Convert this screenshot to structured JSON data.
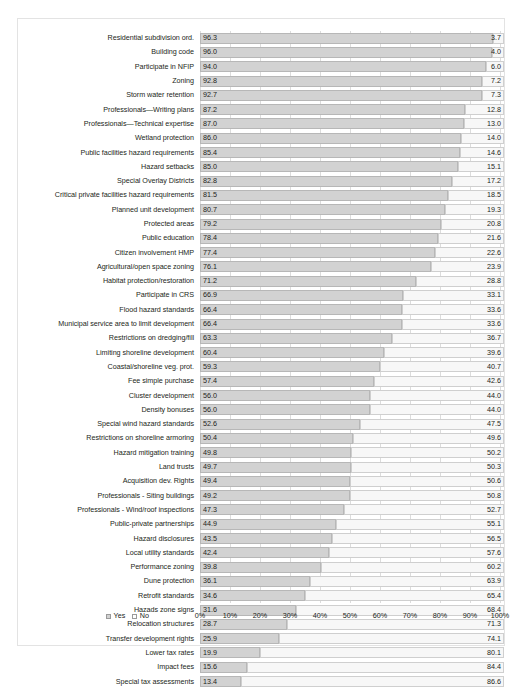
{
  "chart_data": {
    "type": "bar",
    "orientation": "horizontal",
    "stacked": true,
    "percent": true,
    "title": "",
    "subtitle": "",
    "xlabel": "",
    "ylabel": "",
    "xlim": [
      0,
      100
    ],
    "grid": true,
    "legend_position": "bottom-left",
    "x_ticks": [
      "0%",
      "10%",
      "20%",
      "30%",
      "40%",
      "50%",
      "60%",
      "70%",
      "80%",
      "90%",
      "100%"
    ],
    "x_tick_values": [
      0,
      10,
      20,
      30,
      40,
      50,
      60,
      70,
      80,
      90,
      100
    ],
    "legend": [
      {
        "label": "Yes",
        "color": "#d2d2d2",
        "swatch": "yes"
      },
      {
        "label": "No",
        "color": "#ffffff",
        "swatch": "no"
      }
    ],
    "series": [
      {
        "name": "Yes",
        "color": "#d2d2d2"
      },
      {
        "name": "No",
        "color": "#f7f7f7"
      }
    ],
    "categories": [
      "Residential subdivision ord.",
      "Building code",
      "Participate in NFIP",
      "Zoning",
      "Storm water retention",
      "Professionals—Writing plans",
      "Professionals—Technical expertise",
      "Wetland protection",
      "Public facilities hazard requirements",
      "Hazard setbacks",
      "Special Overlay Districts",
      "Critical private facilities hazard requirements",
      "Planned unit development",
      "Protected areas",
      "Public education",
      "Citizen involvement HMP",
      "Agricultural/open space zoning",
      "Habitat protection/restoration",
      "Participate in CRS",
      "Flood hazard standards",
      "Municipal service area to limit development",
      "Restrictions on dredging/fill",
      "Limiting shoreline development",
      "Coastal/shoreline veg. prot.",
      "Fee simple purchase",
      "Cluster development",
      "Density bonuses",
      "Special wind hazard standards",
      "Restrictions on shoreline armoring",
      "Hazard mitigation training",
      "Land trusts",
      "Acquisition dev. Rights",
      "Professionals - Siting buildings",
      "Professionals - Wind/roof inspections",
      "Public-private partnerships",
      "Hazard disclosures",
      "Local utility standards",
      "Performance zoning",
      "Dune protection",
      "Retrofit standards",
      "Hazads zone signs",
      "Relocation structures",
      "Transfer development rights",
      "Lower tax rates",
      "Impact fees",
      "Special tax assessments"
    ],
    "yes_values": [
      96.3,
      96.0,
      94.0,
      92.8,
      92.7,
      87.2,
      87.0,
      86.0,
      85.4,
      85.0,
      82.8,
      81.5,
      80.7,
      79.2,
      78.4,
      77.4,
      76.1,
      71.2,
      66.9,
      66.4,
      66.4,
      63.3,
      60.4,
      59.3,
      57.4,
      56.0,
      56.0,
      52.6,
      50.4,
      49.8,
      49.7,
      49.4,
      49.2,
      47.3,
      44.9,
      43.5,
      42.4,
      39.8,
      36.1,
      34.6,
      31.6,
      28.7,
      25.9,
      19.9,
      15.6,
      13.4
    ],
    "no_values": [
      3.7,
      4.0,
      6.0,
      7.2,
      7.3,
      12.8,
      13.0,
      14.0,
      14.6,
      15.1,
      17.2,
      18.5,
      19.3,
      20.8,
      21.6,
      22.6,
      23.9,
      28.8,
      33.1,
      33.6,
      33.6,
      36.7,
      39.6,
      40.7,
      42.6,
      44.0,
      44.0,
      47.5,
      49.6,
      50.2,
      50.3,
      50.6,
      50.8,
      52.7,
      55.1,
      56.5,
      57.6,
      60.2,
      63.9,
      65.4,
      68.4,
      71.3,
      74.1,
      80.1,
      84.4,
      86.6
    ],
    "yes_labels": [
      "96.3",
      "96.0",
      "94.0",
      "92.8",
      "92.7",
      "87.2",
      "87.0",
      "86.0",
      "85.4",
      "85.0",
      "82.8",
      "81.5",
      "80.7",
      "79.2",
      "78.4",
      "77.4",
      "76.1",
      "71.2",
      "66.9",
      "66.4",
      "66.4",
      "63.3",
      "60.4",
      "59.3",
      "57.4",
      "56.0",
      "56.0",
      "52.6",
      "50.4",
      "49.8",
      "49.7",
      "49.4",
      "49.2",
      "47.3",
      "44.9",
      "43.5",
      "42.4",
      "39.8",
      "36.1",
      "34.6",
      "31.6",
      "28.7",
      "25.9",
      "19.9",
      "15.6",
      "13.4"
    ],
    "no_labels": [
      "3.7",
      "4.0",
      "6.0",
      "7.2",
      "7.3",
      "12.8",
      "13.0",
      "14.0",
      "14.6",
      "15.1",
      "17.2",
      "18.5",
      "19.3",
      "20.8",
      "21.6",
      "22.6",
      "23.9",
      "28.8",
      "33.1",
      "33.6",
      "33.6",
      "36.7",
      "39.6",
      "40.7",
      "42.6",
      "44.0",
      "44.0",
      "47.5",
      "49.6",
      "50.2",
      "50.3",
      "50.6",
      "50.8",
      "52.7",
      "55.1",
      "56.5",
      "57.6",
      "60.2",
      "63.9",
      "65.4",
      "68.4",
      "71.3",
      "74.1",
      "80.1",
      "84.4",
      "86.6"
    ]
  },
  "caption": ""
}
